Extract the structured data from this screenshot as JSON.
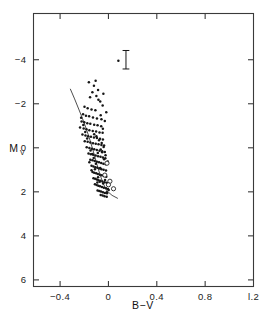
{
  "chart_data": {
    "type": "scatter",
    "title": "",
    "subtitle": "",
    "xlabel": "B−V",
    "ylabel": "M",
    "ylabel_sub": "V",
    "xlim": [
      -0.62,
      1.2
    ],
    "ylim": [
      -6.1,
      6.3
    ],
    "y_inverted": true,
    "grid": false,
    "legend": null,
    "xticks": [
      -0.4,
      0,
      0.4,
      0.8,
      1.2
    ],
    "xticklabels": [
      "−0.4",
      "0",
      "0.4",
      "0.8",
      "l.2"
    ],
    "yticks": [
      -4,
      -2,
      0,
      2,
      4,
      6
    ],
    "yticklabels": [
      "−4",
      "−2",
      "0",
      "2",
      "4",
      "6"
    ],
    "annotations": [
      {
        "name": "error-bar",
        "kind": "errorbar-I",
        "x": 0.145,
        "y": -4.0,
        "half_height": 0.42,
        "cap_half_width": 0.028
      },
      {
        "name": "error-bar-companion-point",
        "kind": "point",
        "x": 0.082,
        "y": -3.95
      }
    ],
    "series": [
      {
        "name": "cluster-members",
        "marker": "filled-circle",
        "color": "#161616",
        "points": [
          [
            -0.162,
            -2.98
          ],
          [
            -0.12,
            -2.82
          ],
          [
            -0.133,
            -2.52
          ],
          [
            -0.1,
            -2.35
          ],
          [
            -0.152,
            -2.3
          ],
          [
            -0.083,
            -2.18
          ],
          [
            -0.198,
            -1.86
          ],
          [
            -0.172,
            -1.8
          ],
          [
            -0.14,
            -1.74
          ],
          [
            -0.108,
            -1.7
          ],
          [
            -0.21,
            -1.52
          ],
          [
            -0.186,
            -1.46
          ],
          [
            -0.16,
            -1.43
          ],
          [
            -0.128,
            -1.38
          ],
          [
            -0.095,
            -1.33
          ],
          [
            -0.058,
            -1.3
          ],
          [
            -0.222,
            -1.2
          ],
          [
            -0.2,
            -1.16
          ],
          [
            -0.175,
            -1.12
          ],
          [
            -0.15,
            -1.09
          ],
          [
            -0.118,
            -1.05
          ],
          [
            -0.09,
            -1.02
          ],
          [
            -0.06,
            -0.98
          ],
          [
            -0.235,
            -0.92
          ],
          [
            -0.205,
            -0.88
          ],
          [
            -0.182,
            -0.84
          ],
          [
            -0.158,
            -0.8
          ],
          [
            -0.13,
            -0.76
          ],
          [
            -0.102,
            -0.74
          ],
          [
            -0.074,
            -0.7
          ],
          [
            -0.048,
            -0.68
          ],
          [
            -0.215,
            -0.6
          ],
          [
            -0.19,
            -0.56
          ],
          [
            -0.168,
            -0.52
          ],
          [
            -0.145,
            -0.5
          ],
          [
            -0.12,
            -0.47
          ],
          [
            -0.095,
            -0.44
          ],
          [
            -0.07,
            -0.41
          ],
          [
            -0.046,
            -0.38
          ],
          [
            -0.196,
            -0.3
          ],
          [
            -0.172,
            -0.27
          ],
          [
            -0.15,
            -0.24
          ],
          [
            -0.128,
            -0.21
          ],
          [
            -0.105,
            -0.18
          ],
          [
            -0.082,
            -0.16
          ],
          [
            -0.058,
            -0.13
          ],
          [
            -0.036,
            -0.1
          ],
          [
            -0.18,
            -0.02
          ],
          [
            -0.158,
            0.01
          ],
          [
            -0.138,
            0.04
          ],
          [
            -0.118,
            0.07
          ],
          [
            -0.096,
            0.1
          ],
          [
            -0.074,
            0.13
          ],
          [
            -0.052,
            0.16
          ],
          [
            -0.03,
            0.19
          ],
          [
            -0.165,
            0.26
          ],
          [
            -0.146,
            0.29
          ],
          [
            -0.126,
            0.32
          ],
          [
            -0.106,
            0.35
          ],
          [
            -0.086,
            0.38
          ],
          [
            -0.066,
            0.41
          ],
          [
            -0.046,
            0.44
          ],
          [
            -0.026,
            0.47
          ],
          [
            -0.15,
            0.54
          ],
          [
            -0.132,
            0.57
          ],
          [
            -0.114,
            0.6
          ],
          [
            -0.096,
            0.63
          ],
          [
            -0.078,
            0.66
          ],
          [
            -0.06,
            0.69
          ],
          [
            -0.042,
            0.72
          ],
          [
            -0.022,
            0.75
          ],
          [
            -0.14,
            0.82
          ],
          [
            -0.124,
            0.85
          ],
          [
            -0.108,
            0.88
          ],
          [
            -0.092,
            0.91
          ],
          [
            -0.076,
            0.94
          ],
          [
            -0.058,
            0.97
          ],
          [
            -0.04,
            1.0
          ],
          [
            -0.02,
            1.03
          ],
          [
            -0.132,
            1.1
          ],
          [
            -0.118,
            1.13
          ],
          [
            -0.102,
            1.16
          ],
          [
            -0.088,
            1.19
          ],
          [
            -0.072,
            1.22
          ],
          [
            -0.056,
            1.25
          ],
          [
            -0.038,
            1.28
          ],
          [
            -0.018,
            1.31
          ],
          [
            -0.124,
            1.38
          ],
          [
            -0.11,
            1.41
          ],
          [
            -0.096,
            1.44
          ],
          [
            -0.082,
            1.47
          ],
          [
            -0.066,
            1.5
          ],
          [
            -0.05,
            1.53
          ],
          [
            -0.032,
            1.56
          ],
          [
            -0.014,
            1.59
          ],
          [
            -0.112,
            1.66
          ],
          [
            -0.098,
            1.69
          ],
          [
            -0.084,
            1.72
          ],
          [
            -0.07,
            1.75
          ],
          [
            -0.054,
            1.78
          ],
          [
            -0.038,
            1.81
          ],
          [
            -0.02,
            1.84
          ],
          [
            -0.004,
            1.87
          ],
          [
            -0.09,
            1.94
          ],
          [
            -0.076,
            1.96
          ],
          [
            -0.062,
            1.99
          ],
          [
            -0.046,
            2.02
          ],
          [
            -0.03,
            2.05
          ],
          [
            -0.012,
            2.07
          ],
          [
            -0.064,
            2.14
          ],
          [
            -0.048,
            2.17
          ],
          [
            -0.032,
            2.2
          ],
          [
            -0.014,
            2.22
          ],
          [
            -0.052,
            0.2
          ],
          [
            -0.036,
            0.52
          ],
          [
            -0.068,
            0.92
          ],
          [
            -0.086,
            1.34
          ],
          [
            -0.104,
            0.72
          ],
          [
            -0.122,
            0.46
          ],
          [
            -0.14,
            1.02
          ],
          [
            -0.158,
            0.66
          ],
          [
            -0.176,
            -0.42
          ],
          [
            -0.192,
            -0.72
          ],
          [
            -0.208,
            -1.04
          ],
          [
            -0.226,
            -1.36
          ],
          [
            -0.044,
            1.62
          ],
          [
            -0.028,
            1.46
          ],
          [
            -0.072,
            1.54
          ],
          [
            -0.092,
            1.58
          ],
          [
            -0.112,
            0.98
          ],
          [
            -0.134,
            0.28
          ],
          [
            -0.148,
            0.12
          ],
          [
            -0.088,
            0.24
          ],
          [
            -0.064,
            0.08
          ],
          [
            -0.04,
            -0.04
          ],
          [
            -0.024,
            0.34
          ],
          [
            -0.006,
            0.62
          ],
          [
            -0.056,
            -0.22
          ],
          [
            -0.078,
            -0.34
          ],
          [
            -0.1,
            -0.52
          ],
          [
            -0.118,
            -0.62
          ],
          [
            -0.046,
            -0.86
          ],
          [
            -0.03,
            -1.22
          ],
          [
            -0.064,
            -1.48
          ],
          [
            -0.018,
            -1.62
          ],
          [
            -0.048,
            -1.92
          ],
          [
            -0.086,
            -2.62
          ],
          [
            -0.068,
            -2.1
          ],
          [
            -0.106,
            -3.04
          ],
          [
            -0.042,
            -2.46
          ],
          [
            -0.014,
            2.02
          ],
          [
            0.002,
            1.92
          ]
        ]
      },
      {
        "name": "special-stars",
        "marker": "open-circle",
        "color": "#161616",
        "points": [
          [
            -0.012,
            0.7
          ],
          [
            0.012,
            1.52
          ],
          [
            0.042,
            1.86
          ],
          [
            -0.03,
            1.24
          ],
          [
            0.0,
            1.68
          ]
        ]
      }
    ],
    "fit_line": {
      "name": "zams-fit",
      "style": "solid",
      "points": [
        [
          -0.316,
          -2.68
        ],
        [
          -0.28,
          -2.22
        ],
        [
          -0.246,
          -1.76
        ],
        [
          -0.214,
          -1.32
        ],
        [
          -0.186,
          -0.9
        ],
        [
          -0.16,
          -0.48
        ],
        [
          -0.138,
          -0.08
        ],
        [
          -0.118,
          0.3
        ],
        [
          -0.1,
          0.66
        ],
        [
          -0.082,
          1.0
        ],
        [
          -0.062,
          1.34
        ],
        [
          -0.04,
          1.66
        ],
        [
          -0.012,
          1.96
        ],
        [
          0.03,
          2.16
        ],
        [
          0.078,
          2.3
        ]
      ]
    }
  },
  "figure": {
    "background_color": "#ffffff",
    "axis_color": "#3a3a3a",
    "marker_color": "#161616"
  }
}
